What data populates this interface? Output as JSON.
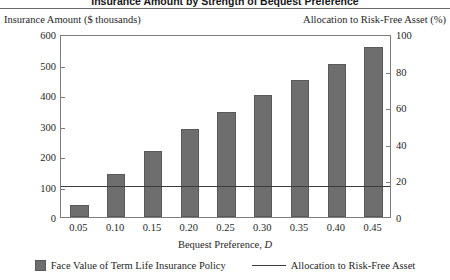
{
  "title": "Insurance Amount by Strength of Bequest Preference",
  "axes": {
    "left_caption": "Insurance Amount ($ thousands)",
    "right_caption": "Allocation to Risk-Free Asset (%)",
    "x_title_main": "Bequest Preference,",
    "x_title_symbol": "D"
  },
  "legend": {
    "bar_label": "Face Value of Term Life Insurance Policy",
    "line_label": "Allocation to Risk-Free Asset"
  },
  "colors": {
    "bar_fill": "#6e6e6e",
    "bar_edge": "#595959",
    "line": "#3a3a3a",
    "frame": "#7d7d7d"
  },
  "chart_data": {
    "type": "bar",
    "title": "Insurance Amount by Strength of Bequest Preference",
    "xlabel": "Bequest Preference, D",
    "ylabel": "Insurance Amount ($ thousands)",
    "y2label": "Allocation to Risk-Free Asset (%)",
    "categories": [
      "0.05",
      "0.10",
      "0.15",
      "0.20",
      "0.25",
      "0.30",
      "0.35",
      "0.40",
      "0.45"
    ],
    "ylim": [
      0,
      600
    ],
    "yticks": [
      0,
      100,
      200,
      300,
      400,
      500,
      600
    ],
    "y2lim": [
      0,
      100
    ],
    "y2ticks": [
      0,
      20,
      40,
      60,
      80,
      100
    ],
    "grid": false,
    "legend_position": "bottom",
    "series": [
      {
        "name": "Face Value of Term Life Insurance Policy",
        "type": "bar",
        "axis": "left",
        "values": [
          40,
          140,
          218,
          287,
          345,
          400,
          450,
          503,
          557
        ]
      },
      {
        "name": "Allocation to Risk-Free Asset",
        "type": "line",
        "axis": "right",
        "values": [
          18,
          18,
          18,
          18,
          18,
          18,
          18,
          18,
          18
        ]
      }
    ]
  }
}
